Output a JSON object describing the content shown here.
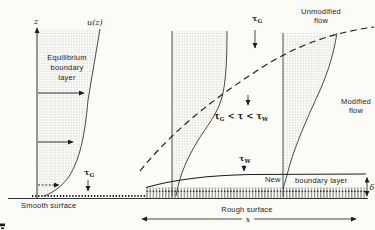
{
  "fig": {
    "colors": {
      "background": "#fbfbf8",
      "ink": "#1c1c1c",
      "stipple": "#b4b4b4"
    },
    "labels": {
      "z": "z",
      "uz": "u(z)",
      "eq1": "Equilibrium",
      "eq2": "boundary",
      "eq3": "layer",
      "tau": "τ",
      "sub_g": "G",
      "sub_w": "W",
      "ineq_mid": " < τ < τ",
      "smooth": "Smooth surface",
      "rough": "Rough surface",
      "unmod1": "Unmodified",
      "unmod2": "flow",
      "mod1": "Modified",
      "mod2": "flow",
      "new": "New",
      "bl": "boundary layer",
      "delta": "δ",
      "x": "x"
    }
  }
}
